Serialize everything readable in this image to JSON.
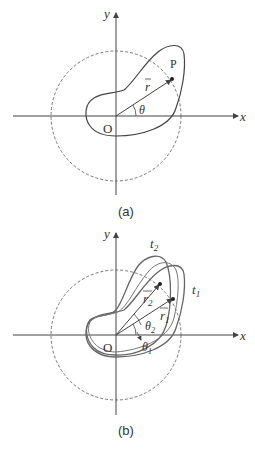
{
  "figure_a": {
    "caption": "(a)",
    "x_axis_label": "x",
    "y_axis_label": "y",
    "origin_label": "O",
    "point_label": "P",
    "vector_label": "r",
    "angle_label": "θ"
  },
  "figure_b": {
    "caption": "(b)",
    "x_axis_label": "x",
    "y_axis_label": "y",
    "origin_label": "O",
    "curve_label_1": "t",
    "curve_label_1_sub": "1",
    "curve_label_2": "t",
    "curve_label_2_sub": "2",
    "vector_label_1": "r",
    "vector_label_1_sub": "1",
    "vector_label_2": "r",
    "vector_label_2_sub": "2",
    "angle_label_1": "θ",
    "angle_label_1_sub": "1",
    "angle_label_2": "θ",
    "angle_label_2_sub": "2"
  },
  "colors": {
    "line": "#444444",
    "curve": "#555555",
    "background": "#ffffff"
  }
}
